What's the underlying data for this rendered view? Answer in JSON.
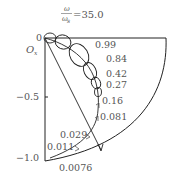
{
  "title": {
    "numerator": "ω",
    "denominator": "ω",
    "denominator_sub": "s",
    "equals": "=35.0"
  },
  "axis": {
    "origin_label": "O",
    "origin_sub": "x",
    "ticks": [
      {
        "label": "0",
        "value": 0
      },
      {
        "label": "−0.5",
        "value": -0.5
      },
      {
        "label": "−1.0",
        "value": -1.0
      }
    ]
  },
  "curve_labels": [
    {
      "label": "0.99"
    },
    {
      "label": "0.84"
    },
    {
      "label": "0.42"
    },
    {
      "label": "0.27"
    },
    {
      "label": "0.16"
    },
    {
      "label": "0.081"
    },
    {
      "label": "0.029"
    },
    {
      "label": "0.011"
    },
    {
      "label": "0.0076"
    }
  ],
  "colors": {
    "line": "#222222",
    "text": "#555555",
    "background": "#ffffff"
  }
}
